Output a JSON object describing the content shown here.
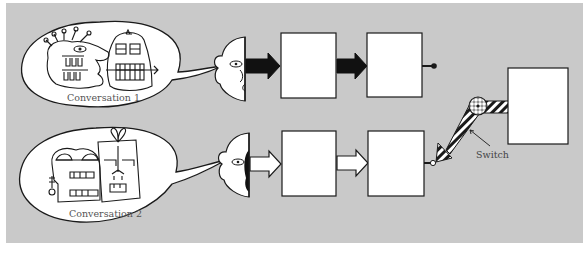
{
  "figure": {
    "background_color": "#c9c9c9",
    "line_color": "#1a1a1a",
    "box_fill": "#ffffff"
  },
  "conversations": [
    {
      "id": 1,
      "caption": "Conversation 1",
      "arrow_style": "filled-black",
      "drawing": "doodle-monster-and-building-face",
      "terminal": "closed-knob"
    },
    {
      "id": 2,
      "caption": "Conversation 2",
      "arrow_style": "outlined-white",
      "drawing": "doodle-skull-and-house-face",
      "terminal": "open-knob"
    }
  ],
  "switch": {
    "label": "Switch",
    "connected_to": "Conversation 2"
  }
}
